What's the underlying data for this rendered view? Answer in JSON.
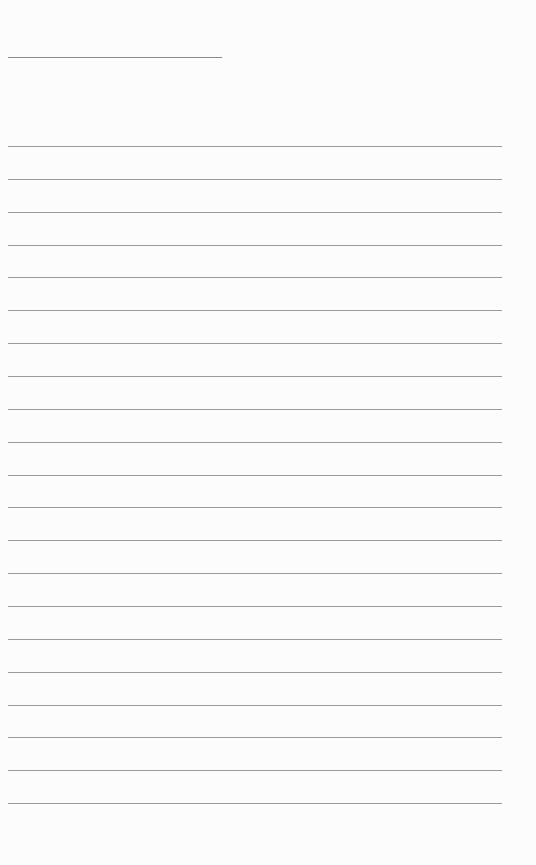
{
  "page": {
    "background": "#fcfcfc",
    "line_color": "#9a9a9a",
    "title_line": {
      "text": ""
    },
    "lines": [
      {
        "text": ""
      },
      {
        "text": ""
      },
      {
        "text": ""
      },
      {
        "text": ""
      },
      {
        "text": ""
      },
      {
        "text": ""
      },
      {
        "text": ""
      },
      {
        "text": ""
      },
      {
        "text": ""
      },
      {
        "text": ""
      },
      {
        "text": ""
      },
      {
        "text": ""
      },
      {
        "text": ""
      },
      {
        "text": ""
      },
      {
        "text": ""
      },
      {
        "text": ""
      },
      {
        "text": ""
      },
      {
        "text": ""
      },
      {
        "text": ""
      },
      {
        "text": ""
      },
      {
        "text": ""
      }
    ]
  }
}
